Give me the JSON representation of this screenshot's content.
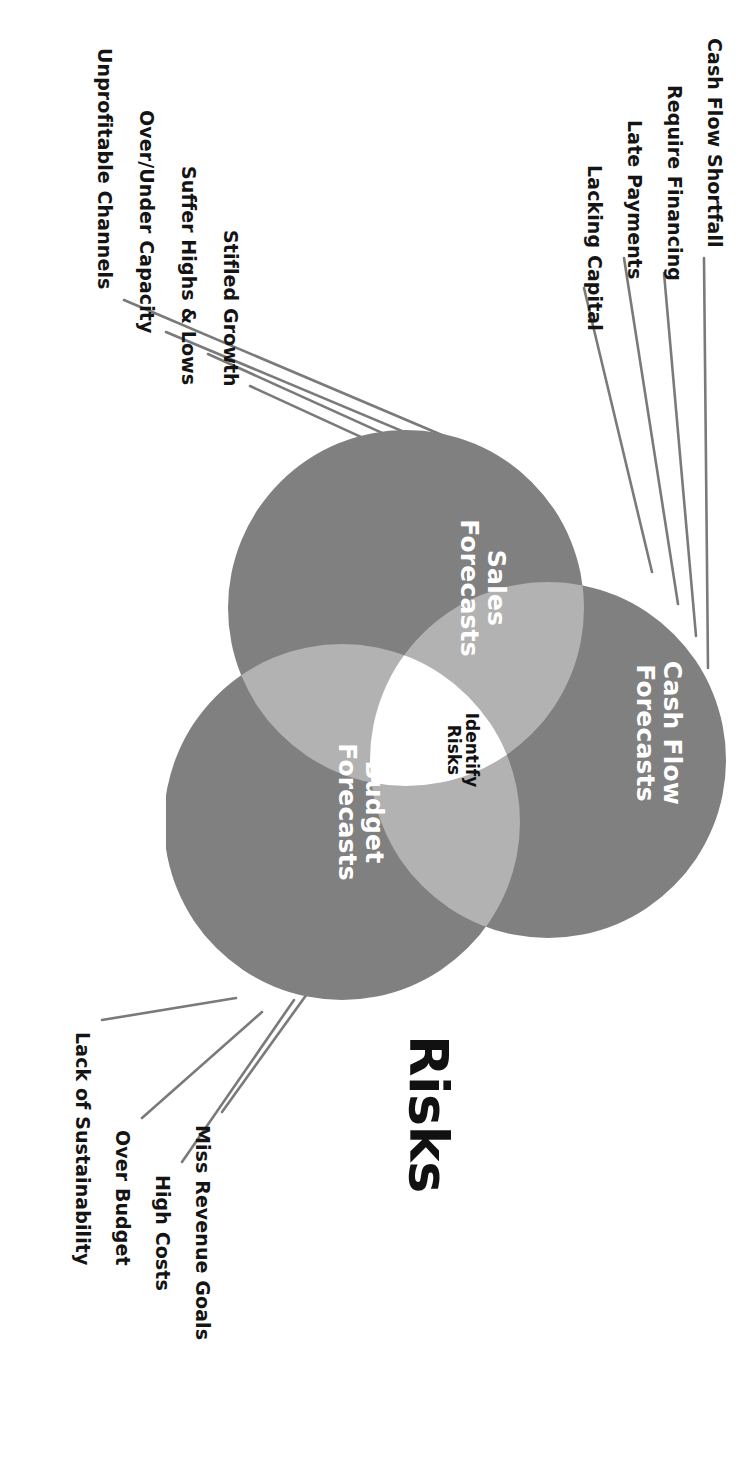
{
  "diagram": {
    "title": "Risks",
    "type": "venn-3-circle",
    "center_label": "Identify\nRisks",
    "colors": {
      "circle_fill": "#808080",
      "overlap_fill": "#b2b2b2",
      "center_fill": "#ffffff",
      "leader_line": "#7a7a7a",
      "circle_text": "#ffffff",
      "center_text": "#111111",
      "title_text": "#111111",
      "background": "#ffffff"
    },
    "circles": [
      {
        "id": "cash-flow",
        "label": "Cash Flow\nForecasts"
      },
      {
        "id": "sales",
        "label": "Sales\nForecasts"
      },
      {
        "id": "budget",
        "label": "Budget\nForecasts"
      }
    ],
    "groups": [
      {
        "id": "cash-flow-risks",
        "attached_to": "Cash Flow Forecasts",
        "items": [
          "Cash Flow Shortfall",
          "Require Financing",
          "Late Payments",
          "Lacking Capital"
        ]
      },
      {
        "id": "sales-risks",
        "attached_to": "Sales Forecasts",
        "items": [
          "Stifled Growth",
          "Suffer Highs & Lows",
          "Over/Under Capacity",
          "Unprofitable Channels"
        ]
      },
      {
        "id": "budget-risks",
        "attached_to": "Budget Forecasts",
        "items": [
          "Miss Revenue Goals",
          "High Costs",
          "Over Budget",
          "Lack of Sustainability"
        ]
      }
    ]
  }
}
